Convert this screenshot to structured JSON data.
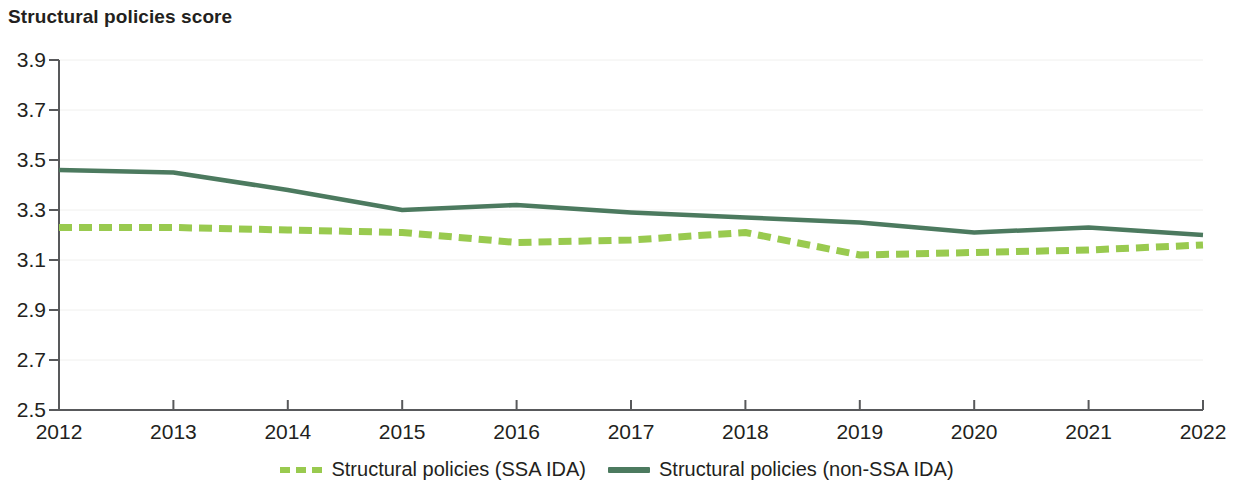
{
  "chart_data": {
    "type": "line",
    "title": "Structural policies score",
    "xlabel": "",
    "ylabel": "",
    "grid": true,
    "legend_position": "bottom-center",
    "x": [
      2012,
      2013,
      2014,
      2015,
      2016,
      2017,
      2018,
      2019,
      2020,
      2021,
      2022
    ],
    "categories": [
      "2012",
      "2013",
      "2014",
      "2015",
      "2016",
      "2017",
      "2018",
      "2019",
      "2020",
      "2021",
      "2022"
    ],
    "xlim": [
      2012,
      2022
    ],
    "ylim": [
      2.5,
      3.9
    ],
    "yticks": [
      "3.9",
      "3.7",
      "3.5",
      "3.3",
      "3.1",
      "2.9",
      "2.7",
      "2.5"
    ],
    "ytick_values": [
      3.9,
      3.7,
      3.5,
      3.3,
      3.1,
      2.9,
      2.7,
      2.5
    ],
    "series": [
      {
        "name": "Structural policies (SSA IDA)",
        "style": "dashed",
        "color": "#99ca4f",
        "values": [
          3.23,
          3.23,
          3.22,
          3.21,
          3.17,
          3.18,
          3.21,
          3.12,
          3.13,
          3.14,
          3.16
        ]
      },
      {
        "name": "Structural policies (non-SSA IDA)",
        "style": "solid",
        "color": "#4c7a5f",
        "values": [
          3.46,
          3.45,
          3.38,
          3.3,
          3.32,
          3.29,
          3.27,
          3.25,
          3.21,
          3.23,
          3.2
        ]
      }
    ]
  },
  "legend": {
    "items": [
      {
        "label": "Structural policies (SSA IDA)",
        "style": "dashed",
        "color": "#99ca4f"
      },
      {
        "label": "Structural policies (non-SSA IDA)",
        "style": "solid",
        "color": "#4c7a5f"
      }
    ]
  },
  "colors": {
    "ssa_ida": "#99ca4f",
    "non_ssa_ida": "#4c7a5f",
    "axis": "#58595b",
    "grid": "#f0f0ee",
    "text": "#231f20"
  }
}
